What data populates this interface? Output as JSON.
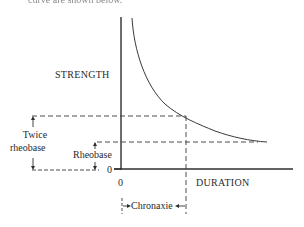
{
  "caption_fragment": "curve are shown below.",
  "diagram": {
    "type": "strength-duration curve",
    "y_axis_label": "STRENGTH",
    "x_axis_label": "DURATION",
    "y_origin_label": "0",
    "x_origin_label": "0",
    "annotations": {
      "twice_rheobase": [
        "Twice",
        "rheobase"
      ],
      "rheobase": "Rheobase",
      "chronaxie": "Chronaxie"
    },
    "colors": {
      "line": "#2f2f2f",
      "background": "#ffffff"
    }
  }
}
